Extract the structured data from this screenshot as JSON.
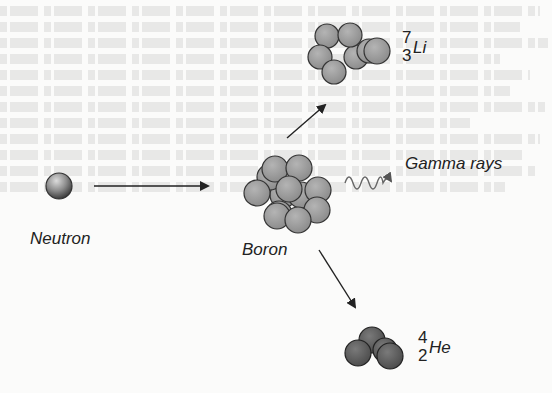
{
  "diagram": {
    "labels": {
      "neutron": "Neutron",
      "boron": "Boron",
      "gamma": "Gamma rays"
    },
    "products": [
      {
        "name": "lithium",
        "mass": "7",
        "number": "3",
        "symbol": "Li"
      },
      {
        "name": "helium",
        "mass": "4",
        "number": "2",
        "symbol": "He"
      }
    ],
    "colors": {
      "neutron": "#808080",
      "boron_nucleon": "#9a9a9a",
      "lithium_nucleon": "#9a9a9a",
      "helium_nucleon": "#5e5e5e",
      "arrow": "#222222",
      "gamma_wave": "#707070"
    }
  }
}
